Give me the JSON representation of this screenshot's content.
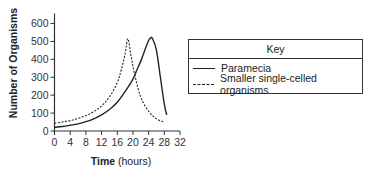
{
  "chart_data": {
    "type": "line",
    "title": "",
    "xlabel_bold": "Time",
    "xlabel_rest": " (hours)",
    "ylabel": "Number of Organisms",
    "xlim": [
      0,
      32
    ],
    "ylim": [
      0,
      600
    ],
    "xticks": [
      0,
      4,
      8,
      12,
      16,
      20,
      24,
      28,
      32
    ],
    "yticks": [
      0,
      100,
      200,
      300,
      400,
      500,
      600
    ],
    "grid": false,
    "legend_position": "right",
    "legend_title": "Key",
    "series": [
      {
        "name": "Paramecia",
        "style": "solid",
        "x": [
          0,
          2,
          4,
          6,
          8,
          10,
          12,
          14,
          16,
          18,
          20,
          21,
          22,
          23,
          24,
          24.5,
          25,
          26,
          27,
          28,
          28.6
        ],
        "y": [
          20,
          25,
          32,
          40,
          52,
          68,
          90,
          120,
          160,
          220,
          290,
          340,
          390,
          450,
          505,
          520,
          515,
          450,
          300,
          150,
          90
        ]
      },
      {
        "name": "Smaller single-celled organisms",
        "style": "dashed",
        "x": [
          0,
          2,
          4,
          6,
          8,
          10,
          12,
          14,
          16,
          17,
          18,
          18.7,
          19.5,
          20.5,
          22,
          24,
          26,
          27.7
        ],
        "y": [
          43,
          50,
          58,
          70,
          86,
          108,
          140,
          190,
          270,
          340,
          430,
          515,
          420,
          310,
          190,
          110,
          68,
          52
        ]
      }
    ]
  },
  "legend": {
    "title": "Key",
    "items": [
      {
        "label": "Paramecia",
        "style": "solid"
      },
      {
        "label": "Smaller single-celled organisms",
        "style": "dashed"
      }
    ]
  },
  "colors": {
    "line": "#222222",
    "axis": "#333333"
  }
}
